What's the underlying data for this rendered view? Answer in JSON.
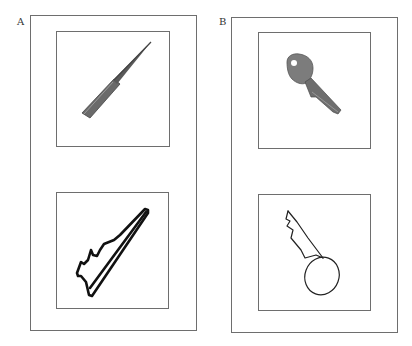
{
  "figure": {
    "panels": [
      {
        "label": "A",
        "top_item": {
          "kind": "photograph",
          "subject": "comb-icon",
          "description": "Photo of a rat-tail comb"
        },
        "bottom_item": {
          "kind": "drawing",
          "subject": "comb-drawing-icon",
          "description": "Line drawing of a comb"
        }
      },
      {
        "label": "B",
        "top_item": {
          "kind": "photograph",
          "subject": "key-icon",
          "description": "Photo of a key"
        },
        "bottom_item": {
          "kind": "drawing",
          "subject": "key-drawing-icon",
          "description": "Line drawing of a key"
        }
      }
    ],
    "colors": {
      "frame": "#6e6e6e",
      "ink": "#111111",
      "photo_dark": "#555555",
      "photo_mid": "#8a8a8a"
    }
  }
}
